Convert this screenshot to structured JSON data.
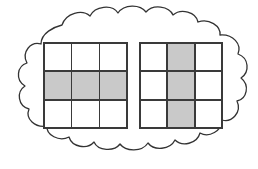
{
  "figure": {
    "description": "Left grid has its middle row shaded; right grid has its middle column shaded.",
    "background_color": "#ffffff",
    "outline_color": "#333333",
    "shade_color": "#c9c9c9",
    "gridline_color": "#3a3a3a",
    "cell_fill_color": "#ffffff"
  },
  "cloud": {
    "label": "cloud-outline",
    "fill": "#ffffff",
    "stroke": "#333333",
    "stroke_width": "1.2"
  },
  "grids": [
    {
      "name": "left-grid",
      "rows": 3,
      "columns": 3,
      "shaded_count": 3,
      "total_count": 9,
      "fraction": "3/9",
      "shading_pattern": "middle-row",
      "cells": [
        {
          "row": 1,
          "col": 1,
          "shaded": false
        },
        {
          "row": 1,
          "col": 2,
          "shaded": false
        },
        {
          "row": 1,
          "col": 3,
          "shaded": false
        },
        {
          "row": 2,
          "col": 1,
          "shaded": true
        },
        {
          "row": 2,
          "col": 2,
          "shaded": true
        },
        {
          "row": 2,
          "col": 3,
          "shaded": true
        },
        {
          "row": 3,
          "col": 1,
          "shaded": false
        },
        {
          "row": 3,
          "col": 2,
          "shaded": false
        },
        {
          "row": 3,
          "col": 3,
          "shaded": false
        }
      ]
    },
    {
      "name": "right-grid",
      "rows": 3,
      "columns": 3,
      "shaded_count": 3,
      "total_count": 9,
      "fraction": "3/9",
      "shading_pattern": "middle-column",
      "cells": [
        {
          "row": 1,
          "col": 1,
          "shaded": false
        },
        {
          "row": 1,
          "col": 2,
          "shaded": true
        },
        {
          "row": 1,
          "col": 3,
          "shaded": false
        },
        {
          "row": 2,
          "col": 1,
          "shaded": false
        },
        {
          "row": 2,
          "col": 2,
          "shaded": true
        },
        {
          "row": 2,
          "col": 3,
          "shaded": false
        },
        {
          "row": 3,
          "col": 1,
          "shaded": false
        },
        {
          "row": 3,
          "col": 2,
          "shaded": true
        },
        {
          "row": 3,
          "col": 3,
          "shaded": false
        }
      ]
    }
  ]
}
